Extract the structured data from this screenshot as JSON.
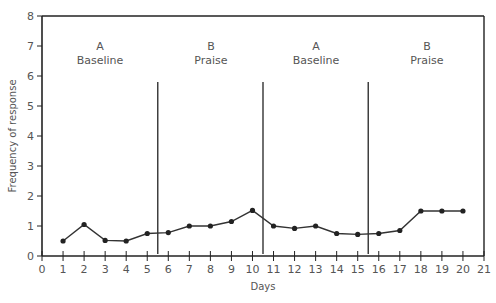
{
  "chart_data": {
    "type": "line",
    "title": "",
    "xlabel": "Days",
    "ylabel": "Frequency of response",
    "xlim": [
      0,
      21
    ],
    "ylim": [
      0,
      8
    ],
    "x_ticks": [
      0,
      1,
      2,
      3,
      4,
      5,
      6,
      7,
      8,
      9,
      10,
      11,
      12,
      13,
      14,
      15,
      16,
      17,
      18,
      19,
      20,
      21
    ],
    "y_ticks": [
      0,
      1,
      2,
      3,
      4,
      5,
      6,
      7,
      8
    ],
    "grid": false,
    "legend": null,
    "phases": [
      {
        "letter": "A",
        "name": "Baseline",
        "days": [
          1,
          5
        ]
      },
      {
        "letter": "B",
        "name": "Praise",
        "days": [
          6,
          10
        ]
      },
      {
        "letter": "A",
        "name": "Baseline",
        "days": [
          11,
          15
        ]
      },
      {
        "letter": "B",
        "name": "Praise",
        "days": [
          16,
          20
        ]
      }
    ],
    "phase_change_lines": [
      5.5,
      10.5,
      15.5
    ],
    "phase_line_height": 5.8,
    "series": [
      {
        "name": "Frequency of response",
        "x": [
          1,
          2,
          3,
          4,
          5,
          6,
          7,
          8,
          9,
          10,
          11,
          12,
          13,
          14,
          15,
          16,
          17,
          18,
          19,
          20
        ],
        "values": [
          0.5,
          1.05,
          0.52,
          0.5,
          0.75,
          0.78,
          1.0,
          1.0,
          1.15,
          1.52,
          1.0,
          0.92,
          1.0,
          0.75,
          0.72,
          0.75,
          0.85,
          1.5,
          1.5,
          1.5
        ]
      }
    ]
  },
  "labels": {
    "phase1_letter": "A",
    "phase1_name": "Baseline",
    "phase2_letter": "B",
    "phase2_name": "Praise",
    "phase3_letter": "A",
    "phase3_name": "Baseline",
    "phase4_letter": "B",
    "phase4_name": "Praise",
    "xlabel": "Days",
    "ylabel": "Frequency of response"
  },
  "colors": {
    "axis": "#222222",
    "line": "#333333",
    "marker": "#222222",
    "text": "#555555"
  }
}
